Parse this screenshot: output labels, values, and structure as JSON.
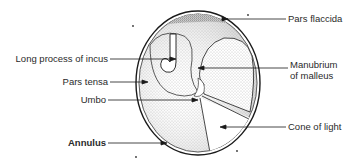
{
  "figure": {
    "labels": {
      "pars_flaccida": "Pars flaccida",
      "long_process_of_incus": "Long process of incus",
      "manubrium_line1": "Manubrium",
      "manubrium_line2": "of malleus",
      "pars_tensa": "Pars tensa",
      "umbo": "Umbo",
      "cone_of_light": "Cone of light",
      "annulus": "Annulus"
    },
    "colors": {
      "ink": "#1a1a1a",
      "stipple": "#7a7a7a",
      "background": "#ffffff"
    }
  }
}
